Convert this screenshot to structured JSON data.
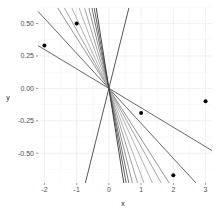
{
  "chart_data": {
    "type": "scatter",
    "title": "",
    "xlabel": "x",
    "ylabel": "y",
    "xlim": [
      -2.2,
      3.2
    ],
    "ylim": [
      -0.73,
      0.62
    ],
    "grid": true,
    "legend": "none",
    "x_ticks": [
      "-2",
      "-1",
      "0",
      "1",
      "2",
      "3"
    ],
    "x_tick_values": [
      -2,
      -1,
      0,
      1,
      2,
      3
    ],
    "y_ticks": [
      "0.50",
      "0.25",
      "0.00",
      "-0.25",
      "-0.50"
    ],
    "y_tick_values": [
      0.5,
      0.25,
      0,
      -0.25,
      -0.5
    ],
    "points": [
      {
        "x": -2,
        "y": 0.33
      },
      {
        "x": -1,
        "y": 0.5
      },
      {
        "x": 1,
        "y": -0.19
      },
      {
        "x": 2,
        "y": -0.67
      },
      {
        "x": 3,
        "y": -0.1
      }
    ],
    "lines_through_origin": {
      "intercept": 0,
      "slopes": [
        -0.15,
        -0.27,
        -0.39,
        -0.45,
        -0.54,
        -0.67,
        -0.82,
        -1.0,
        -1.18,
        -1.36,
        -1.58,
        1.0
      ],
      "colors": [
        "#555555",
        "#555555",
        "#888888",
        "#999999",
        "#aaaaaa",
        "#aaaaaa",
        "#999999",
        "#888888",
        "#666666",
        "#555555",
        "#333333",
        "#444444"
      ]
    }
  }
}
